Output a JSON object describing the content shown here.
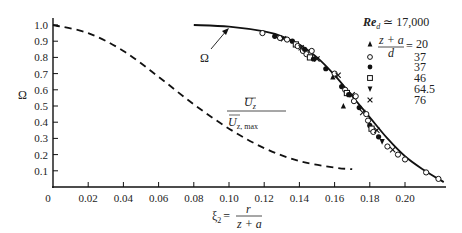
{
  "chart_data": {
    "type": "line",
    "title": "",
    "xlabel": "ξ2 = r / (z + a)",
    "ylabel": "Ω",
    "xlim": [
      0,
      0.225
    ],
    "ylim": [
      0,
      1.05
    ],
    "grid": false,
    "x_ticks": [
      "0",
      "0.02",
      "0.04",
      "0.06",
      "0.08",
      "0.10",
      "0.12",
      "0.14",
      "0.16",
      "0.18",
      "0.20"
    ],
    "y_ticks": [
      "0.1",
      "0.2",
      "0.3",
      "0.4",
      "0.5",
      "0.6",
      "0.7",
      "0.8",
      "0.9",
      "1.0"
    ],
    "annotations": [
      {
        "text": "Ω",
        "points_to": "solid curve",
        "x": 0.088,
        "y": 0.82
      },
      {
        "text": "Ū_z / Ū_z,max",
        "label_for": "dashed curve",
        "x": 0.105,
        "y": 0.5
      },
      {
        "text": "Re_d ≃ 17,000",
        "position": "upper right"
      }
    ],
    "series": [
      {
        "name": "Ω",
        "style": "solid",
        "x": [
          0.08,
          0.1,
          0.12,
          0.13,
          0.14,
          0.15,
          0.16,
          0.17,
          0.18,
          0.19,
          0.2,
          0.21,
          0.222
        ],
        "y": [
          1.0,
          0.99,
          0.96,
          0.93,
          0.88,
          0.8,
          0.69,
          0.56,
          0.43,
          0.3,
          0.19,
          0.11,
          0.03
        ]
      },
      {
        "name": "Ū_z / Ū_z,max",
        "style": "dashed",
        "x": [
          0.0,
          0.02,
          0.04,
          0.06,
          0.08,
          0.1,
          0.12,
          0.14,
          0.16,
          0.17
        ],
        "y": [
          1.0,
          0.95,
          0.84,
          0.68,
          0.51,
          0.36,
          0.24,
          0.16,
          0.12,
          0.11
        ]
      }
    ],
    "legend": {
      "position": "upper right",
      "header": "(z + a)/d =",
      "entries": [
        {
          "marker": "triangle-up",
          "label": "20"
        },
        {
          "marker": "circle-open",
          "label": "37"
        },
        {
          "marker": "circle-filled",
          "label": "37"
        },
        {
          "marker": "square-open",
          "label": "46"
        },
        {
          "marker": "triangle-down",
          "label": "64.5"
        },
        {
          "marker": "x",
          "label": "76"
        }
      ]
    },
    "scatter_points": [
      {
        "m": "circle-open",
        "x": 0.119,
        "y": 0.95
      },
      {
        "m": "circle-filled",
        "x": 0.126,
        "y": 0.93
      },
      {
        "m": "circle-open",
        "x": 0.129,
        "y": 0.92
      },
      {
        "m": "x",
        "x": 0.131,
        "y": 0.915
      },
      {
        "m": "circle-open",
        "x": 0.133,
        "y": 0.91
      },
      {
        "m": "circle-filled",
        "x": 0.136,
        "y": 0.9
      },
      {
        "m": "square-open",
        "x": 0.138,
        "y": 0.88
      },
      {
        "m": "circle-open",
        "x": 0.139,
        "y": 0.87
      },
      {
        "m": "x",
        "x": 0.141,
        "y": 0.86
      },
      {
        "m": "circle-open",
        "x": 0.142,
        "y": 0.84
      },
      {
        "m": "circle-filled",
        "x": 0.143,
        "y": 0.85
      },
      {
        "m": "circle-open",
        "x": 0.144,
        "y": 0.82
      },
      {
        "m": "square-open",
        "x": 0.146,
        "y": 0.8
      },
      {
        "m": "circle-open",
        "x": 0.147,
        "y": 0.84
      },
      {
        "m": "circle-filled",
        "x": 0.148,
        "y": 0.79
      },
      {
        "m": "x",
        "x": 0.15,
        "y": 0.79
      },
      {
        "m": "circle-filled",
        "x": 0.155,
        "y": 0.73
      },
      {
        "m": "triangle-up",
        "x": 0.159,
        "y": 0.68
      },
      {
        "m": "circle-open",
        "x": 0.16,
        "y": 0.7
      },
      {
        "m": "x",
        "x": 0.162,
        "y": 0.69
      },
      {
        "m": "circle-filled",
        "x": 0.164,
        "y": 0.62
      },
      {
        "m": "circle-open",
        "x": 0.166,
        "y": 0.6
      },
      {
        "m": "square-open",
        "x": 0.167,
        "y": 0.58
      },
      {
        "m": "circle-filled",
        "x": 0.168,
        "y": 0.57
      },
      {
        "m": "x",
        "x": 0.17,
        "y": 0.57
      },
      {
        "m": "circle-open",
        "x": 0.171,
        "y": 0.53
      },
      {
        "m": "triangle-up",
        "x": 0.165,
        "y": 0.5
      },
      {
        "m": "circle-open",
        "x": 0.172,
        "y": 0.56
      },
      {
        "m": "circle-filled",
        "x": 0.174,
        "y": 0.49
      },
      {
        "m": "x",
        "x": 0.176,
        "y": 0.46
      },
      {
        "m": "circle-open",
        "x": 0.178,
        "y": 0.45
      },
      {
        "m": "circle-open",
        "x": 0.179,
        "y": 0.41
      },
      {
        "m": "circle-filled",
        "x": 0.18,
        "y": 0.38
      },
      {
        "m": "square-open",
        "x": 0.181,
        "y": 0.36
      },
      {
        "m": "circle-open",
        "x": 0.182,
        "y": 0.34
      },
      {
        "m": "x",
        "x": 0.184,
        "y": 0.35
      },
      {
        "m": "circle-filled",
        "x": 0.185,
        "y": 0.31
      },
      {
        "m": "triangle-down",
        "x": 0.187,
        "y": 0.28
      },
      {
        "m": "circle-open",
        "x": 0.19,
        "y": 0.25
      },
      {
        "m": "x",
        "x": 0.193,
        "y": 0.23
      },
      {
        "m": "circle-open",
        "x": 0.196,
        "y": 0.2
      },
      {
        "m": "circle-open",
        "x": 0.2,
        "y": 0.17
      },
      {
        "m": "circle-open",
        "x": 0.212,
        "y": 0.09
      },
      {
        "m": "circle-open",
        "x": 0.219,
        "y": 0.05
      }
    ]
  },
  "labels": {
    "y_axis": "Ω",
    "x_axis_prefix": "ξ",
    "x_axis_sub": "2",
    "x_axis_eq": "=",
    "x_axis_num": "r",
    "x_axis_den": "z + a",
    "omega_annot": "Ω",
    "dashed_num": "U",
    "dashed_num_sub": "z",
    "dashed_den": "U",
    "dashed_den_sub": "z, max",
    "re_label": "Re",
    "re_sub": "d",
    "re_value": "≃ 17,000",
    "legend_num": "z + a",
    "legend_den": "d",
    "legend_eq": "=",
    "legend_values": [
      "20",
      "37",
      "37",
      "46",
      "64.5",
      "76"
    ]
  }
}
